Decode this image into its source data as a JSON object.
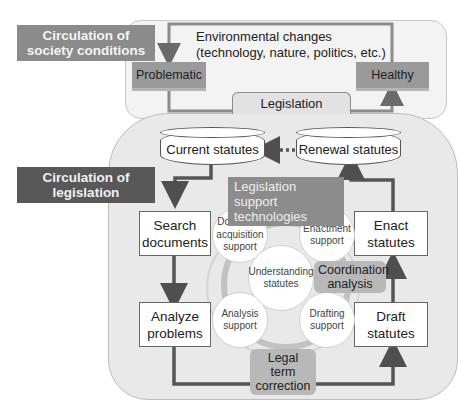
{
  "society": {
    "label": "Circulation of society conditions",
    "label_line1": "Circulation of",
    "label_line2": "society conditions",
    "environment_line1": "Environmental changes",
    "environment_line2": "(technology, nature, politics, etc.)",
    "state_problematic": "Problematic",
    "state_healthy": "Healthy",
    "legislation": "Legislation"
  },
  "legislation_cycle": {
    "label_line1": "Circulation of",
    "label_line2": "legislation",
    "current_statutes": "Current statutes",
    "renewal_statutes": "Renewal statutes",
    "steps": [
      {
        "line1": "Search",
        "line2": "documents"
      },
      {
        "line1": "Analyze",
        "line2": "problems"
      },
      {
        "line1": "Draft",
        "line2": "statutes"
      },
      {
        "line1": "Enact",
        "line2": "statutes"
      }
    ]
  },
  "support": {
    "title_line1": "Legislation support",
    "title_line2": "technologies",
    "circles": [
      {
        "line1": "Document",
        "line2": "acquisition",
        "line3": "support"
      },
      {
        "line1": "Enactment",
        "line2": "support"
      },
      {
        "line1": "Understanding",
        "line2": "statutes"
      },
      {
        "line1": "Analysis",
        "line2": "support"
      },
      {
        "line1": "Drafting",
        "line2": "support"
      }
    ],
    "coordination_line1": "Coordination",
    "coordination_line2": "analysis",
    "legal_term_line1": "Legal term",
    "legal_term_line2": "correction"
  },
  "colors": {
    "dark_tag": "#585858",
    "mid_tag": "#8b8b8b",
    "panel_light": "#f3f3f3",
    "panel_mid": "#e9e9e9",
    "arrow": "#5c5c5c"
  }
}
